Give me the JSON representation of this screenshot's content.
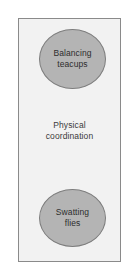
{
  "diagram": {
    "type": "concept-grouping",
    "frame": {
      "fill_color": "#f2f2f2",
      "border_color": "#8a8a8a"
    },
    "node_fill_color": "#b4b4b4",
    "node_border_color": "#7d7d7d",
    "text_color": "#2d2d2d",
    "nodes": [
      {
        "id": "top",
        "shape": "ellipse",
        "lines": [
          "Balancing",
          "teacups"
        ]
      },
      {
        "id": "bottom",
        "shape": "ellipse",
        "lines": [
          "Swatting",
          "flies"
        ]
      }
    ],
    "center_label": {
      "lines": [
        "Physical",
        "coordination"
      ]
    }
  }
}
